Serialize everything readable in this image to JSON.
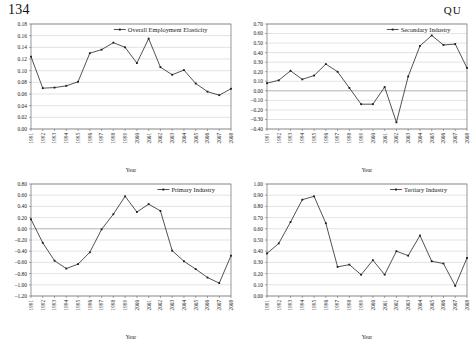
{
  "page": {
    "folio": "134",
    "running_head": "QU"
  },
  "common": {
    "xlabel": "Year",
    "categories": [
      "1991",
      "1992",
      "1993",
      "1994",
      "1995",
      "1996",
      "1997",
      "1998",
      "1999",
      "2000",
      "2001",
      "2002",
      "2003",
      "2004",
      "2005",
      "2006",
      "2007",
      "2008"
    ],
    "legend_marker": "line-with-square-marker-icon"
  },
  "chart_data": [
    {
      "id": "overall-employment-elasticity",
      "type": "line",
      "title": "",
      "legend": [
        "Overall Employment Elasticity"
      ],
      "legend_position": "top-right-inside",
      "grid": true,
      "xlabel": "Year",
      "ylabel": "",
      "categories": [
        "1991",
        "1992",
        "1993",
        "1994",
        "1995",
        "1996",
        "1997",
        "1998",
        "1999",
        "2000",
        "2001",
        "2002",
        "2003",
        "2004",
        "2005",
        "2006",
        "2007",
        "2008"
      ],
      "ylim": [
        0.0,
        0.18
      ],
      "ytick_step": 0.02,
      "ytick_labels": [
        "0.00",
        "0.02",
        "0.04",
        "0.06",
        "0.08",
        "0.10",
        "0.12",
        "0.14",
        "0.16",
        "0.18"
      ],
      "series": [
        {
          "name": "Overall Employment Elasticity",
          "values": [
            0.124,
            0.07,
            0.071,
            0.074,
            0.081,
            0.13,
            0.136,
            0.148,
            0.14,
            0.113,
            0.155,
            0.106,
            0.093,
            0.101,
            0.078,
            0.064,
            0.058,
            0.069
          ]
        }
      ]
    },
    {
      "id": "secondary-industry",
      "type": "line",
      "title": "",
      "legend": [
        "Secondary Industry"
      ],
      "legend_position": "top-right-inside",
      "grid": true,
      "xlabel": "Year",
      "ylabel": "",
      "categories": [
        "1991",
        "1992",
        "1993",
        "1994",
        "1995",
        "1996",
        "1997",
        "1998",
        "1999",
        "2000",
        "2001",
        "2002",
        "2003",
        "2004",
        "2005",
        "2006",
        "2007",
        "2008"
      ],
      "ylim": [
        -0.4,
        0.7
      ],
      "ytick_step": 0.1,
      "ytick_labels": [
        "-0.40",
        "-0.30",
        "-0.20",
        "-0.10",
        "0.00",
        "0.10",
        "0.20",
        "0.30",
        "0.40",
        "0.50",
        "0.60",
        "0.70"
      ],
      "series": [
        {
          "name": "Secondary Industry",
          "values": [
            0.08,
            0.11,
            0.21,
            0.12,
            0.16,
            0.28,
            0.2,
            0.03,
            -0.14,
            -0.14,
            0.04,
            -0.33,
            0.15,
            0.47,
            0.58,
            0.48,
            0.49,
            0.24
          ]
        }
      ]
    },
    {
      "id": "primary-industry",
      "type": "line",
      "title": "",
      "legend": [
        "Primary Industry"
      ],
      "legend_position": "top-right-inside",
      "grid": true,
      "xlabel": "Year",
      "ylabel": "",
      "categories": [
        "1991",
        "1992",
        "1993",
        "1994",
        "1995",
        "1996",
        "1997",
        "1998",
        "1999",
        "2000",
        "2001",
        "2002",
        "2003",
        "2004",
        "2005",
        "2006",
        "2007",
        "2008"
      ],
      "ylim": [
        -1.2,
        0.8
      ],
      "ytick_step": 0.2,
      "ytick_labels": [
        "-1.20",
        "-1.00",
        "-0.80",
        "-0.60",
        "-0.40",
        "-0.20",
        "0.00",
        "0.20",
        "0.40",
        "0.60",
        "0.80"
      ],
      "series": [
        {
          "name": "Primary Industry",
          "values": [
            0.17,
            -0.25,
            -0.57,
            -0.71,
            -0.63,
            -0.42,
            -0.01,
            0.26,
            0.58,
            0.3,
            0.44,
            0.32,
            -0.39,
            -0.58,
            -0.72,
            -0.87,
            -0.97,
            -0.48
          ]
        }
      ]
    },
    {
      "id": "tertiary-industry",
      "type": "line",
      "title": "",
      "legend": [
        "Tertiary Industry"
      ],
      "legend_position": "top-right-inside",
      "grid": true,
      "xlabel": "Year",
      "ylabel": "",
      "categories": [
        "1991",
        "1992",
        "1993",
        "1994",
        "1995",
        "1996",
        "1997",
        "1998",
        "1999",
        "2000",
        "2001",
        "2002",
        "2003",
        "2004",
        "2005",
        "2006",
        "2007",
        "2008"
      ],
      "ylim": [
        0.0,
        1.0
      ],
      "ytick_step": 0.1,
      "ytick_labels": [
        "0.00",
        "0.10",
        "0.20",
        "0.30",
        "0.40",
        "0.50",
        "0.60",
        "0.70",
        "0.80",
        "0.90",
        "1.00"
      ],
      "series": [
        {
          "name": "Tertiary Industry",
          "values": [
            0.38,
            0.47,
            0.66,
            0.86,
            0.89,
            0.65,
            0.26,
            0.28,
            0.19,
            0.32,
            0.19,
            0.4,
            0.36,
            0.54,
            0.31,
            0.29,
            0.09,
            0.34
          ]
        }
      ]
    }
  ]
}
